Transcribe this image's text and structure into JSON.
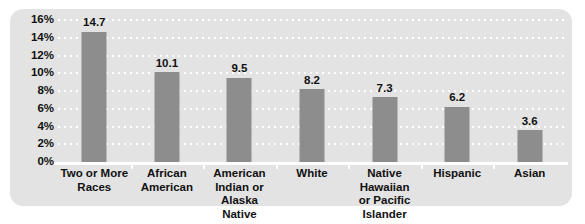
{
  "chart_data": {
    "type": "bar",
    "title": "",
    "subtitle": "",
    "xlabel": "",
    "ylabel": "",
    "ylim": [
      0,
      16
    ],
    "ytick_step": 2,
    "grid": true,
    "grid_style": "dotted-horizontal-white",
    "legend": "none",
    "orientation": "vertical",
    "value_label_format": "one-decimal",
    "categories": [
      "Two or More Races",
      "African American",
      "American Indian or Alaska Native",
      "White",
      "Native Hawaiian or Pacific Islander",
      "Hispanic",
      "Asian"
    ],
    "category_lines": [
      [
        "Two or More",
        "Races"
      ],
      [
        "African",
        "American"
      ],
      [
        "American",
        "Indian or",
        "Alaska Native"
      ],
      [
        "White"
      ],
      [
        "Native Hawaiian",
        "or Pacific Islander"
      ],
      [
        "Hispanic"
      ],
      [
        "Asian"
      ]
    ],
    "values": [
      14.7,
      10.1,
      9.5,
      8.2,
      7.3,
      6.2,
      3.6
    ],
    "value_labels": [
      "14.7",
      "10.1",
      "9.5",
      "8.2",
      "7.3",
      "6.2",
      "3.6"
    ],
    "ytick_labels": [
      "16%",
      "14%",
      "12%",
      "10%",
      "8%",
      "6%",
      "4%",
      "2%",
      "0%"
    ],
    "ytick_values": [
      16,
      14,
      12,
      10,
      8,
      6,
      4,
      2,
      0
    ]
  },
  "colors": {
    "panel_background": "#e3e3e3",
    "bar_fill": "#8d8d8d",
    "gridline": "#ffffff",
    "axis_line": "#ffffff",
    "text": "#111111",
    "page_background": "#ffffff"
  }
}
